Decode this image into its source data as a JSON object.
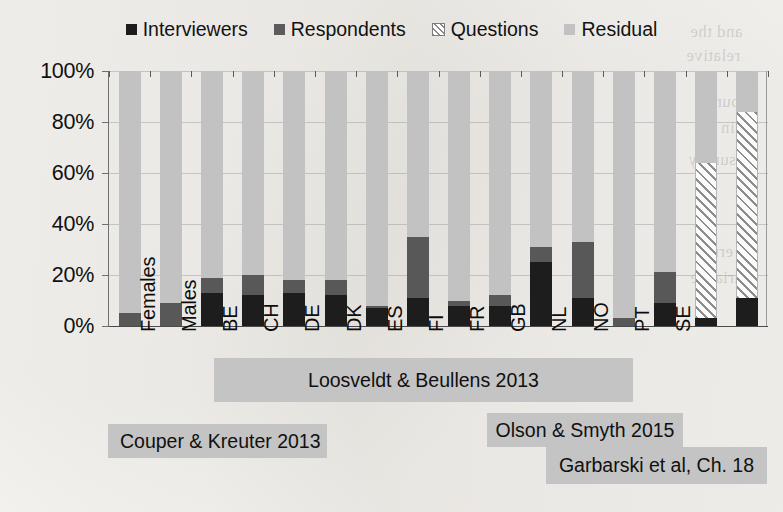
{
  "chart_data": {
    "type": "bar",
    "subtype": "stacked-100-percent-column",
    "title": "",
    "xlabel": "",
    "ylabel": "",
    "ylim": [
      0,
      100
    ],
    "ytick_labels": [
      "0%",
      "20%",
      "40%",
      "60%",
      "80%",
      "100%"
    ],
    "ytick_values": [
      0,
      20,
      40,
      60,
      80,
      100
    ],
    "grid": true,
    "legend_position": "top-center",
    "legend": [
      "Interviewers",
      "Respondents",
      "Questions",
      "Residual"
    ],
    "colors": {
      "Interviewers": "#1d1d1d",
      "Respondents": "#585858",
      "Questions": "#ffffff",
      "Residual": "#c2c2c2",
      "group_band": "#c4c4c4"
    },
    "categories": [
      "Females",
      "Males",
      "BE",
      "CH",
      "DE",
      "DK",
      "ES",
      "FI",
      "FR",
      "GB",
      "NL",
      "NO",
      "PT",
      "SE",
      "",
      ""
    ],
    "series": [
      {
        "name": "Interviewers",
        "values": [
          0,
          0,
          13,
          12,
          13,
          12,
          7,
          11,
          8,
          8,
          25,
          11,
          0,
          9,
          3,
          11
        ]
      },
      {
        "name": "Respondents",
        "values": [
          5,
          9,
          6,
          8,
          5,
          6,
          1,
          24,
          2,
          4,
          6,
          22,
          3,
          12,
          0,
          0
        ]
      },
      {
        "name": "Questions",
        "values": [
          0,
          0,
          0,
          0,
          0,
          0,
          0,
          0,
          0,
          0,
          0,
          0,
          0,
          0,
          61,
          73
        ]
      },
      {
        "name": "Residual",
        "values": [
          95,
          91,
          81,
          80,
          82,
          82,
          92,
          65,
          90,
          88,
          69,
          67,
          97,
          79,
          36,
          16
        ]
      }
    ],
    "groups": [
      {
        "label": "Couper & Kreuter 2013",
        "categories": [
          "Females",
          "Males"
        ]
      },
      {
        "label": "Loosveldt & Beullens 2013",
        "categories": [
          "BE",
          "CH",
          "DE",
          "DK",
          "ES",
          "FI",
          "FR",
          "GB",
          "NL",
          "NO",
          "PT",
          "SE"
        ]
      },
      {
        "label": "Olson & Smyth 2015",
        "categories": [
          ""
        ]
      },
      {
        "label": "Garbarski et al, Ch. 18",
        "categories": [
          ""
        ]
      }
    ]
  },
  "legend": {
    "items": [
      {
        "label": "Interviewers",
        "swatch": "solid-dark-swatch"
      },
      {
        "label": "Respondents",
        "swatch": "solid-gray-swatch"
      },
      {
        "label": "Questions",
        "swatch": "hatched-swatch"
      },
      {
        "label": "Residual",
        "swatch": "solid-light-swatch"
      }
    ]
  },
  "axis": {
    "y_labels": [
      "100%",
      "80%",
      "60%",
      "40%",
      "20%",
      "0%"
    ]
  },
  "x_labels": [
    "Females",
    "Males",
    "BE",
    "CH",
    "DE",
    "DK",
    "ES",
    "FI",
    "FR",
    "GB",
    "NL",
    "NO",
    "PT",
    "SE"
  ],
  "group_bands": [
    {
      "label": "Couper & Kreuter 2013"
    },
    {
      "label": "Loosveldt & Beullens 2013"
    },
    {
      "label": "Olson & Smyth 2015"
    },
    {
      "label": "Garbarski et al, Ch. 18"
    }
  ],
  "background_ghost_text": [
    "and the",
    "relative",
    "source",
    "in the",
    "survey",
    "error",
    "variance"
  ]
}
